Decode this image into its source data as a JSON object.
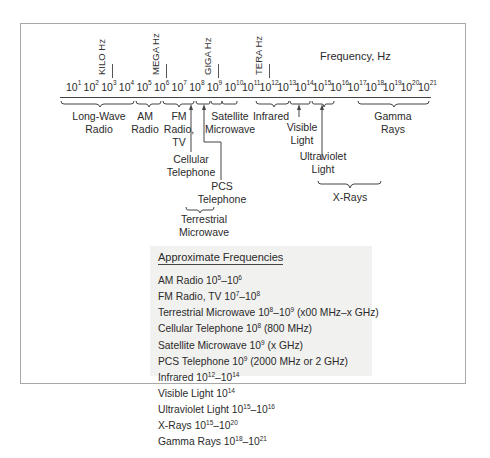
{
  "diagram": {
    "title": "Frequency, Hz",
    "unit_labels": [
      {
        "id": "kilo",
        "text": "KILO Hz"
      },
      {
        "id": "mega",
        "text": "MEGA Hz"
      },
      {
        "id": "giga",
        "text": "GIGA Hz"
      },
      {
        "id": "tera",
        "text": "TERA Hz"
      }
    ],
    "ticks": [
      {
        "base": "10",
        "exp": "1"
      },
      {
        "base": "10",
        "exp": "2"
      },
      {
        "base": "10",
        "exp": "3"
      },
      {
        "base": "10",
        "exp": "4"
      },
      {
        "base": "10",
        "exp": "5"
      },
      {
        "base": "10",
        "exp": "6"
      },
      {
        "base": "10",
        "exp": "7"
      },
      {
        "base": "10",
        "exp": "8"
      },
      {
        "base": "10",
        "exp": "9"
      },
      {
        "base": "10",
        "exp": "10"
      },
      {
        "base": "10",
        "exp": "11"
      },
      {
        "base": "10",
        "exp": "12"
      },
      {
        "base": "10",
        "exp": "13"
      },
      {
        "base": "10",
        "exp": "14"
      },
      {
        "base": "10",
        "exp": "15"
      },
      {
        "base": "10",
        "exp": "16"
      },
      {
        "base": "10",
        "exp": "17"
      },
      {
        "base": "10",
        "exp": "18"
      },
      {
        "base": "10",
        "exp": "19"
      },
      {
        "base": "10",
        "exp": "20"
      },
      {
        "base": "10",
        "exp": "21"
      }
    ],
    "bands": {
      "long_wave": {
        "line1": "Long-Wave",
        "line2": "Radio"
      },
      "am": {
        "line1": "AM",
        "line2": "Radio"
      },
      "fm": {
        "line1": "FM",
        "line2": "Radio,",
        "line3": "TV"
      },
      "satellite": {
        "line1": "Satellite",
        "line2": "Microwave"
      },
      "cellular": {
        "line1": "Cellular",
        "line2": "Telephone"
      },
      "pcs": {
        "line1": "PCS",
        "line2": "Telephone"
      },
      "terrestrial": {
        "line1": "Terrestrial",
        "line2": "Microwave"
      },
      "infrared": {
        "line1": "Infrared"
      },
      "visible": {
        "line1": "Visible",
        "line2": "Light"
      },
      "ultraviolet": {
        "line1": "Ultraviolet",
        "line2": "Light"
      },
      "xrays": {
        "line1": "X-Rays"
      },
      "gamma": {
        "line1": "Gamma",
        "line2": "Rays"
      }
    }
  },
  "legend": {
    "title": "Approximate Frequencies",
    "items": [
      {
        "name": "AM Radio",
        "range": [
          {
            "b": " 10",
            "e": "5"
          },
          {
            "b": "–10",
            "e": "6"
          }
        ],
        "note": ""
      },
      {
        "name": "FM Radio, TV",
        "range": [
          {
            "b": " 10",
            "e": "7"
          },
          {
            "b": "–10",
            "e": "8"
          }
        ],
        "note": ""
      },
      {
        "name": "Terrestrial Microwave",
        "range": [
          {
            "b": " 10",
            "e": "8"
          },
          {
            "b": "–10",
            "e": "9"
          }
        ],
        "note": " (x00 MHz–x GHz)"
      },
      {
        "name": "Cellular Telephone",
        "range": [
          {
            "b": " 10",
            "e": "8"
          }
        ],
        "note": " (800 MHz)"
      },
      {
        "name": "Satellite Microwave",
        "range": [
          {
            "b": " 10",
            "e": "9"
          }
        ],
        "note": " (x GHz)"
      },
      {
        "name": "PCS Telephone",
        "range": [
          {
            "b": " 10",
            "e": "9"
          }
        ],
        "note": " (2000 MHz or 2 GHz)"
      },
      {
        "name": "Infrared",
        "range": [
          {
            "b": " 10",
            "e": "12"
          },
          {
            "b": "–10",
            "e": "14"
          }
        ],
        "note": ""
      },
      {
        "name": "Visible Light",
        "range": [
          {
            "b": " 10",
            "e": "14"
          }
        ],
        "note": ""
      },
      {
        "name": "Ultraviolet Light",
        "range": [
          {
            "b": " 10",
            "e": "15"
          },
          {
            "b": "–10",
            "e": "16"
          }
        ],
        "note": ""
      },
      {
        "name": "X-Rays",
        "range": [
          {
            "b": " 10",
            "e": "15"
          },
          {
            "b": "–10",
            "e": "20"
          }
        ],
        "note": ""
      },
      {
        "name": "Gamma Rays",
        "range": [
          {
            "b": " 10",
            "e": "18"
          },
          {
            "b": "–10",
            "e": "21"
          }
        ],
        "note": ""
      }
    ]
  }
}
